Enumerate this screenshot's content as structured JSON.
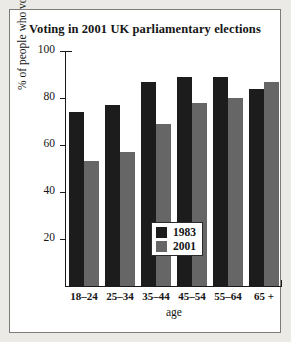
{
  "chart_data": {
    "type": "bar",
    "title": "Voting in 2001 UK parliamentary elections",
    "xlabel": "age",
    "ylabel": "% of people who voted",
    "categories": [
      "18–24",
      "25–34",
      "35–44",
      "45–54",
      "55–64",
      "65 +"
    ],
    "series": [
      {
        "name": "1983",
        "color": "#1c1c1c",
        "values": [
          74,
          77,
          87,
          89,
          89,
          84
        ]
      },
      {
        "name": "2001",
        "color": "#666666",
        "values": [
          53,
          57,
          69,
          78,
          80,
          87
        ]
      }
    ],
    "ylim": [
      0,
      100
    ],
    "yticks": [
      20,
      40,
      60,
      80,
      100
    ],
    "ytick_labels": [
      "20",
      "40",
      "60",
      "80",
      "100"
    ],
    "grid": false,
    "legend_position": "bottom-right-inside"
  }
}
